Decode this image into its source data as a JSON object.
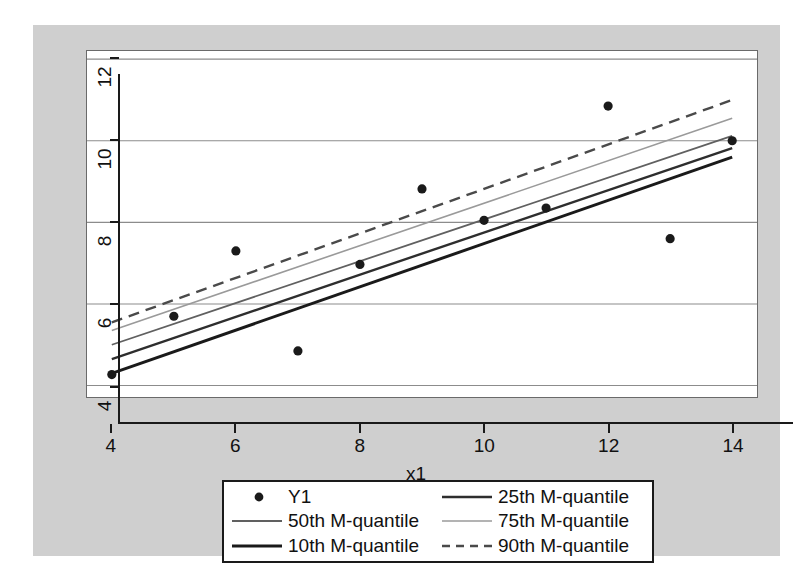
{
  "chart_data": {
    "type": "scatter",
    "title": "",
    "xlabel": "x1",
    "ylabel": "",
    "xlim": [
      3.6,
      14.4
    ],
    "ylim": [
      3.72,
      12.2
    ],
    "xticks": [
      4,
      6,
      8,
      10,
      12,
      14
    ],
    "yticks": [
      4,
      6,
      8,
      10,
      12
    ],
    "grid": "horizontal",
    "legend_position": "below-plot",
    "scatter": {
      "name": "Y1",
      "marker": "filled-circle",
      "color": "#1a1a1a",
      "x": [
        4,
        5,
        6,
        7,
        8,
        9,
        10,
        11,
        12,
        13,
        14
      ],
      "y": [
        4.27,
        5.7,
        7.3,
        4.85,
        6.97,
        8.82,
        8.05,
        8.35,
        10.85,
        7.6,
        10.0
      ]
    },
    "series": [
      {
        "name": "10th M-quantile",
        "style": "solid",
        "color": "#1a1a1a",
        "width": 3.0,
        "x": [
          4,
          14
        ],
        "y": [
          4.3,
          9.6
        ]
      },
      {
        "name": "25th M-quantile",
        "style": "solid",
        "color": "#2e2e2e",
        "width": 2.4,
        "x": [
          4,
          14
        ],
        "y": [
          4.65,
          9.82
        ]
      },
      {
        "name": "50th M-quantile",
        "style": "solid",
        "color": "#606060",
        "width": 1.8,
        "x": [
          4,
          14
        ],
        "y": [
          5.0,
          10.12
        ]
      },
      {
        "name": "75th M-quantile",
        "style": "solid",
        "color": "#9a9a9a",
        "width": 1.6,
        "x": [
          4,
          14
        ],
        "y": [
          5.35,
          10.55
        ]
      },
      {
        "name": "90th M-quantile",
        "style": "dashed",
        "color": "#4a4a4a",
        "width": 2.4,
        "x": [
          4,
          14
        ],
        "y": [
          5.55,
          11.0
        ]
      }
    ]
  },
  "axes": {
    "y_tick_labels": [
      "12",
      "10",
      "8",
      "6",
      "4"
    ],
    "x_tick_labels": [
      "4",
      "6",
      "8",
      "10",
      "12",
      "14"
    ],
    "x_title": "x1"
  },
  "legend": {
    "entries": [
      {
        "label": "Y1",
        "key": "marker-circle"
      },
      {
        "label": "25th M-quantile",
        "key": "line-solid-dark"
      },
      {
        "label": "50th M-quantile",
        "key": "line-solid-mid"
      },
      {
        "label": "75th M-quantile",
        "key": "line-solid-light"
      },
      {
        "label": "10th M-quantile",
        "key": "line-solid-black"
      },
      {
        "label": "90th M-quantile",
        "key": "line-dashed"
      }
    ]
  },
  "colors": {
    "figure_background": "#cfcfcf",
    "plot_background": "#ffffff",
    "gridline": "#8c8c8c",
    "axis": "#1a1a1a",
    "text": "#111111"
  }
}
